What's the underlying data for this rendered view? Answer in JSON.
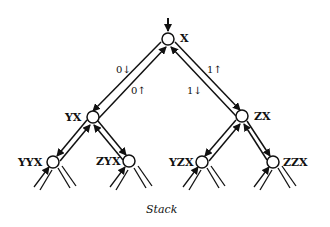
{
  "caption": "Stack",
  "colors": {
    "ink": "#111111",
    "background": "#ffffff",
    "arrow_fill": "#333333"
  },
  "nodes": [
    {
      "id": "X",
      "label": "X",
      "x": 168,
      "y": 39
    },
    {
      "id": "YX",
      "label": "YX",
      "x": 93,
      "y": 117
    },
    {
      "id": "ZX",
      "label": "ZX",
      "x": 242,
      "y": 116
    },
    {
      "id": "YYX",
      "label": "YYX",
      "x": 53,
      "y": 162
    },
    {
      "id": "ZYX",
      "label": "ZYX",
      "x": 129,
      "y": 161
    },
    {
      "id": "YZX",
      "label": "YZX",
      "x": 202,
      "y": 162
    },
    {
      "id": "ZZX",
      "label": "ZZX",
      "x": 273,
      "y": 162
    }
  ],
  "edge_labels": {
    "x_to_yx_push": "0↓",
    "yx_to_x_pop": "0↑",
    "x_to_zx_pop": "1↑",
    "zx_to_x_push": "1↓"
  },
  "entry_arrow": {
    "target": "X",
    "direction": "down"
  }
}
